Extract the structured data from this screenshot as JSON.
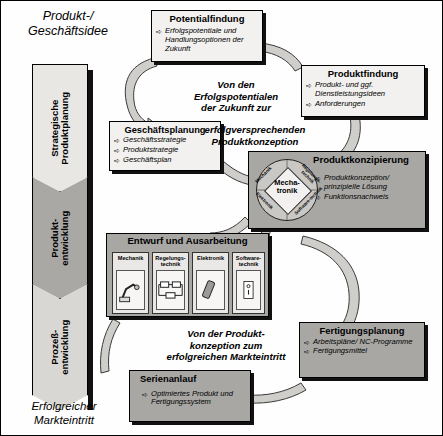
{
  "diagram": {
    "top_label": "Produkt-/\nGeschäftsidee",
    "bottom_label": "Erfolgreicher\nMarkteintritt",
    "top_label_line1": "Produkt-/",
    "top_label_line2": "Geschäftsidee",
    "bottom_label_line1": "Erfolgreicher",
    "bottom_label_line2": "Markteintritt"
  },
  "phases": [
    {
      "name": "strategische-produktplanung",
      "line1": "Strategische",
      "line2": "Produktplanung",
      "color": "#e8e7e4"
    },
    {
      "name": "produktentwicklung",
      "line1": "Produkt-",
      "line2": "entwicklung",
      "color": "#a9a8a5"
    },
    {
      "name": "prozessentwicklung",
      "line1": "Prozeß-",
      "line2": "entwicklung",
      "color": "#d8d7d4"
    }
  ],
  "boxes": {
    "potentialfindung": {
      "title": "Potentialfindung",
      "items": [
        "Erfolgspotentiale und Handlungsoptionen der Zukunft"
      ]
    },
    "produktfindung": {
      "title": "Produktfindung",
      "items": [
        "Produkt- und ggf. Dienstleistungsideen",
        "Anforderungen"
      ]
    },
    "geschaeftsplanung": {
      "title": "Geschäftsplanung",
      "items": [
        "Geschäftsstrategie",
        "Produktstrategie",
        "Geschäftsplan"
      ]
    },
    "produktkonzipierung": {
      "title": "Produktkonzipierung",
      "items": [
        "Produktkonzeption/ prinzipielle Lösung",
        "Funktionsnachweis"
      ]
    },
    "entwurf": {
      "title": "Entwurf und Ausarbeitung",
      "disciplines": [
        {
          "name": "mechanik",
          "line1": "Mechanik",
          "line2": "",
          "icon": "robot-arm-icon"
        },
        {
          "name": "regelungstechnik",
          "line1": "Regelungs-",
          "line2": "technik",
          "icon": "control-loop-icon"
        },
        {
          "name": "elektronik",
          "line1": "Elektronik",
          "line2": "",
          "icon": "circuit-component-icon"
        },
        {
          "name": "softwaretechnik",
          "line1": "Software-",
          "line2": "technik",
          "icon": "software-code-icon"
        }
      ]
    },
    "fertigungsplanung": {
      "title": "Fertigungsplanung",
      "items": [
        "Arbeitspläne/ NC-Programme",
        "Fertigungsmittel"
      ]
    },
    "serienanlauf": {
      "title": "Serienanlauf",
      "items": [
        "Optimiertes Produkt und Fertigungssystem"
      ]
    }
  },
  "wheel": {
    "center_line1": "Mecha-",
    "center_line2": "tronik",
    "quadrants": [
      "Mechanik",
      "Regelungs- technik",
      "Elektronik",
      "Software- technik"
    ],
    "q_mechanik": "Mechanik",
    "q_regelungstechnik": "Regelungs-technik",
    "q_elektronik": "Elektronik",
    "q_softwaretechnik": "Software-technik"
  },
  "captions": {
    "upper": {
      "line1": "Von den",
      "line2": "Erfolgspotentialen",
      "line3": "der Zukunft zur",
      "line4": "erfolgversprechenden",
      "line5": "Produktkonzeption"
    },
    "lower": {
      "line1": "Von der Produkt-",
      "line2": "konzeption zum",
      "line3": "erfolgreichen Markteintritt"
    }
  },
  "colors": {
    "light_fill": "#f2f1ef",
    "gray_fill": "#a8a7a4",
    "ribbon": "#cfcecb",
    "shadow": "#111111",
    "background": "#fefefe"
  },
  "icons": {
    "bullet_arrow": "➪"
  }
}
